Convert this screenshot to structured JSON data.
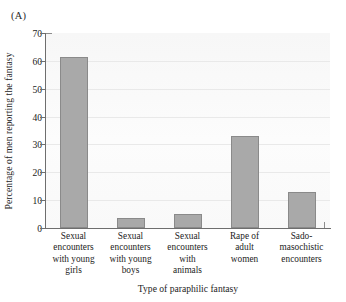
{
  "figure": {
    "panel_label": "(A)"
  },
  "chart_data": {
    "type": "bar",
    "title": "",
    "xlabel": "Type of paraphilic fantasy",
    "ylabel": "Percentage of men reporting the fantasy",
    "categories": [
      "Sexual encounters with young girls",
      "Sexual encounters with young boys",
      "Sexual encounters with animals",
      "Rape of adult women",
      "Sado-masochistic encounters"
    ],
    "category_lines": [
      [
        "Sexual",
        "encounters",
        "with young",
        "girls"
      ],
      [
        "Sexual",
        "encounters",
        "with young",
        "boys"
      ],
      [
        "Sexual",
        "encounters",
        "with",
        "animals"
      ],
      [
        "Rape of",
        "adult",
        "women"
      ],
      [
        "Sado-",
        "masochistic",
        "encounters"
      ]
    ],
    "values": [
      61.5,
      3.5,
      5.0,
      33.0,
      13.0
    ],
    "ylim": [
      0,
      70
    ],
    "yticks": [
      0,
      10,
      20,
      30,
      40,
      50,
      60,
      70
    ],
    "ytick_labels": [
      "0",
      "10",
      "20",
      "30",
      "40",
      "50",
      "60",
      "70"
    ],
    "grid": true,
    "legend": "none",
    "bar_color": "#a9a9a9",
    "bar_edge_color": "#8a8a8a",
    "axis_color": "#6e6e6e",
    "plot_background": "#fbfbfb"
  }
}
